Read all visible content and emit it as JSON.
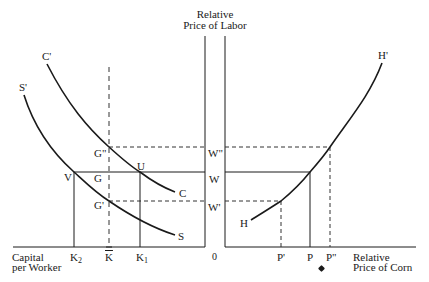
{
  "diagram": {
    "axes": {
      "vertical_title_line1": "Relative",
      "vertical_title_line2": "Price of Labor",
      "left_horizontal_title_line1": "Capital",
      "left_horizontal_title_line2": "per Worker",
      "right_horizontal_title_line1": "Relative",
      "right_horizontal_title_line2": "Price of Corn",
      "origin": "0"
    },
    "curves": {
      "C_start": "C'",
      "C_end": "C",
      "S_start": "S'",
      "S_end": "S",
      "H_start": "H",
      "H_end": "H'"
    },
    "points": {
      "G_double": "G\"",
      "G": "G",
      "G_prime": "G'",
      "U": "U",
      "V": "V"
    },
    "wage_levels": {
      "W_double": "W\"",
      "W": "W",
      "W_prime": "W'"
    },
    "capital_ticks": {
      "K2": "K",
      "K2_sub": "2",
      "Kbar": "K",
      "K1": "K",
      "K1_sub": "1"
    },
    "price_ticks": {
      "P_prime": "P'",
      "P": "P",
      "P_double": "P\""
    },
    "colors": {
      "line": "#1a1a1a",
      "dashed": "#333333"
    }
  }
}
